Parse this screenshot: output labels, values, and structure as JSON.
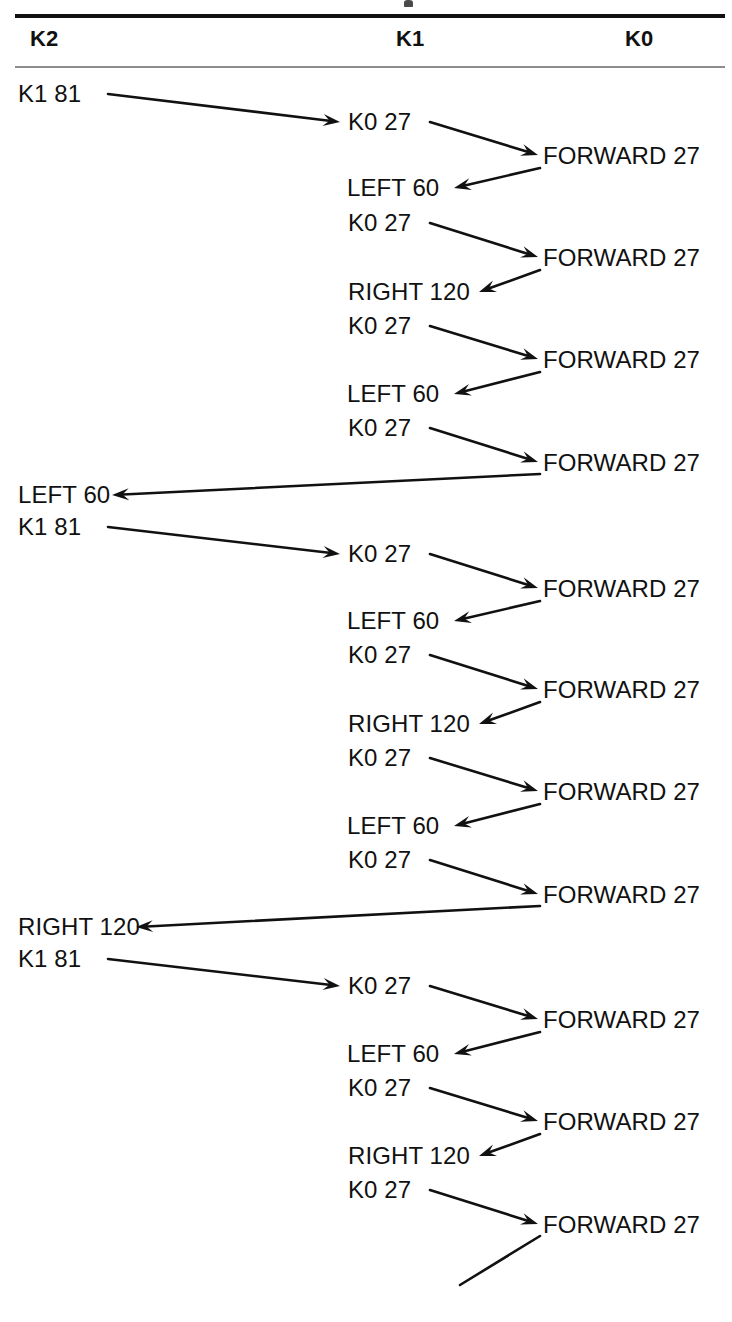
{
  "header": {
    "columns": [
      {
        "label": "K2"
      },
      {
        "label": "K1"
      },
      {
        "label": "K0"
      }
    ]
  },
  "diagram": {
    "type": "recursion-call-trace",
    "nodes": [
      {
        "id": "n01",
        "column": "K2",
        "label": "K1 81",
        "x": 18,
        "y": 100
      },
      {
        "id": "n02",
        "column": "K1",
        "label": "K0 27",
        "x": 348,
        "y": 128
      },
      {
        "id": "n03",
        "column": "K0",
        "label": "FORWARD 27",
        "x": 543,
        "y": 162
      },
      {
        "id": "n04",
        "column": "K1",
        "label": "LEFT 60",
        "x": 347,
        "y": 194
      },
      {
        "id": "n05",
        "column": "K1",
        "label": "K0 27",
        "x": 348,
        "y": 229
      },
      {
        "id": "n06",
        "column": "K0",
        "label": "FORWARD 27",
        "x": 543,
        "y": 264
      },
      {
        "id": "n07",
        "column": "K1",
        "label": "RIGHT 120",
        "x": 348,
        "y": 298
      },
      {
        "id": "n08",
        "column": "K1",
        "label": "K0 27",
        "x": 348,
        "y": 332
      },
      {
        "id": "n09",
        "column": "K0",
        "label": "FORWARD 27",
        "x": 543,
        "y": 366
      },
      {
        "id": "n10",
        "column": "K1",
        "label": "LEFT 60",
        "x": 347,
        "y": 400
      },
      {
        "id": "n11",
        "column": "K1",
        "label": "K0 27",
        "x": 348,
        "y": 434
      },
      {
        "id": "n12",
        "column": "K0",
        "label": "FORWARD 27",
        "x": 543,
        "y": 469
      },
      {
        "id": "n13",
        "column": "K2",
        "label": "LEFT 60",
        "x": 18,
        "y": 501
      },
      {
        "id": "n14",
        "column": "K2",
        "label": "K1 81",
        "x": 18,
        "y": 533
      },
      {
        "id": "n15",
        "column": "K1",
        "label": "K0 27",
        "x": 348,
        "y": 560
      },
      {
        "id": "n16",
        "column": "K0",
        "label": "FORWARD 27",
        "x": 543,
        "y": 595
      },
      {
        "id": "n17",
        "column": "K1",
        "label": "LEFT 60",
        "x": 347,
        "y": 627
      },
      {
        "id": "n18",
        "column": "K1",
        "label": "K0 27",
        "x": 348,
        "y": 661
      },
      {
        "id": "n19",
        "column": "K0",
        "label": "FORWARD 27",
        "x": 543,
        "y": 696
      },
      {
        "id": "n20",
        "column": "K1",
        "label": "RIGHT 120",
        "x": 348,
        "y": 730
      },
      {
        "id": "n21",
        "column": "K1",
        "label": "K0 27",
        "x": 348,
        "y": 764
      },
      {
        "id": "n22",
        "column": "K0",
        "label": "FORWARD 27",
        "x": 543,
        "y": 798
      },
      {
        "id": "n23",
        "column": "K1",
        "label": "LEFT 60",
        "x": 347,
        "y": 832
      },
      {
        "id": "n24",
        "column": "K1",
        "label": "K0 27",
        "x": 348,
        "y": 866
      },
      {
        "id": "n25",
        "column": "K0",
        "label": "FORWARD 27",
        "x": 543,
        "y": 901
      },
      {
        "id": "n26",
        "column": "K2",
        "label": "RIGHT 120",
        "x": 18,
        "y": 933
      },
      {
        "id": "n27",
        "column": "K2",
        "label": "K1 81",
        "x": 18,
        "y": 965
      },
      {
        "id": "n28",
        "column": "K1",
        "label": "K0 27",
        "x": 348,
        "y": 992
      },
      {
        "id": "n29",
        "column": "K0",
        "label": "FORWARD 27",
        "x": 543,
        "y": 1026
      },
      {
        "id": "n30",
        "column": "K1",
        "label": "LEFT 60",
        "x": 347,
        "y": 1060
      },
      {
        "id": "n31",
        "column": "K1",
        "label": "K0 27",
        "x": 348,
        "y": 1094
      },
      {
        "id": "n32",
        "column": "K0",
        "label": "FORWARD 27",
        "x": 543,
        "y": 1128
      },
      {
        "id": "n33",
        "column": "K1",
        "label": "RIGHT 120",
        "x": 348,
        "y": 1162
      },
      {
        "id": "n34",
        "column": "K1",
        "label": "K0 27",
        "x": 348,
        "y": 1196
      },
      {
        "id": "n35",
        "column": "K0",
        "label": "FORWARD 27",
        "x": 543,
        "y": 1231
      }
    ],
    "edges": [
      {
        "from": "n01",
        "to": "n02",
        "x1": 108,
        "y1": 94,
        "x2": 340,
        "y2": 122,
        "head": "end"
      },
      {
        "from": "n02",
        "to": "n03",
        "x1": 430,
        "y1": 122,
        "x2": 538,
        "y2": 155,
        "head": "end"
      },
      {
        "from": "n03",
        "to": "n04",
        "x1": 540,
        "y1": 168,
        "x2": 454,
        "y2": 188,
        "head": "end"
      },
      {
        "from": "n05",
        "to": "n06",
        "x1": 430,
        "y1": 223,
        "x2": 538,
        "y2": 257,
        "head": "end"
      },
      {
        "from": "n06",
        "to": "n07",
        "x1": 540,
        "y1": 270,
        "x2": 479,
        "y2": 292,
        "head": "end"
      },
      {
        "from": "n08",
        "to": "n09",
        "x1": 430,
        "y1": 326,
        "x2": 538,
        "y2": 359,
        "head": "end"
      },
      {
        "from": "n09",
        "to": "n10",
        "x1": 540,
        "y1": 372,
        "x2": 454,
        "y2": 394,
        "head": "end"
      },
      {
        "from": "n11",
        "to": "n12",
        "x1": 430,
        "y1": 428,
        "x2": 538,
        "y2": 462,
        "head": "end"
      },
      {
        "from": "n12",
        "to": "n13",
        "x1": 540,
        "y1": 474,
        "x2": 112,
        "y2": 495,
        "head": "end"
      },
      {
        "from": "n14",
        "to": "n15",
        "x1": 108,
        "y1": 527,
        "x2": 340,
        "y2": 554,
        "head": "end"
      },
      {
        "from": "n15",
        "to": "n16",
        "x1": 430,
        "y1": 554,
        "x2": 538,
        "y2": 588,
        "head": "end"
      },
      {
        "from": "n16",
        "to": "n17",
        "x1": 540,
        "y1": 601,
        "x2": 454,
        "y2": 621,
        "head": "end"
      },
      {
        "from": "n18",
        "to": "n19",
        "x1": 430,
        "y1": 655,
        "x2": 538,
        "y2": 689,
        "head": "end"
      },
      {
        "from": "n19",
        "to": "n20",
        "x1": 540,
        "y1": 702,
        "x2": 479,
        "y2": 724,
        "head": "end"
      },
      {
        "from": "n21",
        "to": "n22",
        "x1": 430,
        "y1": 758,
        "x2": 538,
        "y2": 791,
        "head": "end"
      },
      {
        "from": "n22",
        "to": "n23",
        "x1": 540,
        "y1": 804,
        "x2": 454,
        "y2": 826,
        "head": "end"
      },
      {
        "from": "n24",
        "to": "n25",
        "x1": 430,
        "y1": 860,
        "x2": 538,
        "y2": 894,
        "head": "end"
      },
      {
        "from": "n25",
        "to": "n26",
        "x1": 540,
        "y1": 906,
        "x2": 136,
        "y2": 927,
        "head": "end"
      },
      {
        "from": "n27",
        "to": "n28",
        "x1": 108,
        "y1": 959,
        "x2": 340,
        "y2": 986,
        "head": "end"
      },
      {
        "from": "n28",
        "to": "n29",
        "x1": 430,
        "y1": 986,
        "x2": 538,
        "y2": 1019,
        "head": "end"
      },
      {
        "from": "n29",
        "to": "n30",
        "x1": 540,
        "y1": 1032,
        "x2": 454,
        "y2": 1054,
        "head": "end"
      },
      {
        "from": "n31",
        "to": "n32",
        "x1": 430,
        "y1": 1088,
        "x2": 538,
        "y2": 1121,
        "head": "end"
      },
      {
        "from": "n32",
        "to": "n33",
        "x1": 540,
        "y1": 1134,
        "x2": 479,
        "y2": 1156,
        "head": "end"
      },
      {
        "from": "n34",
        "to": "n35",
        "x1": 430,
        "y1": 1190,
        "x2": 538,
        "y2": 1224,
        "head": "end"
      },
      {
        "from": "n35",
        "to": null,
        "x1": 540,
        "y1": 1236,
        "x2": 460,
        "y2": 1285,
        "head": "none"
      }
    ]
  },
  "colors": {
    "ink": "#111111",
    "rule_strong": "#111111",
    "rule_light": "#8d8d8d",
    "page": "#ffffff"
  }
}
